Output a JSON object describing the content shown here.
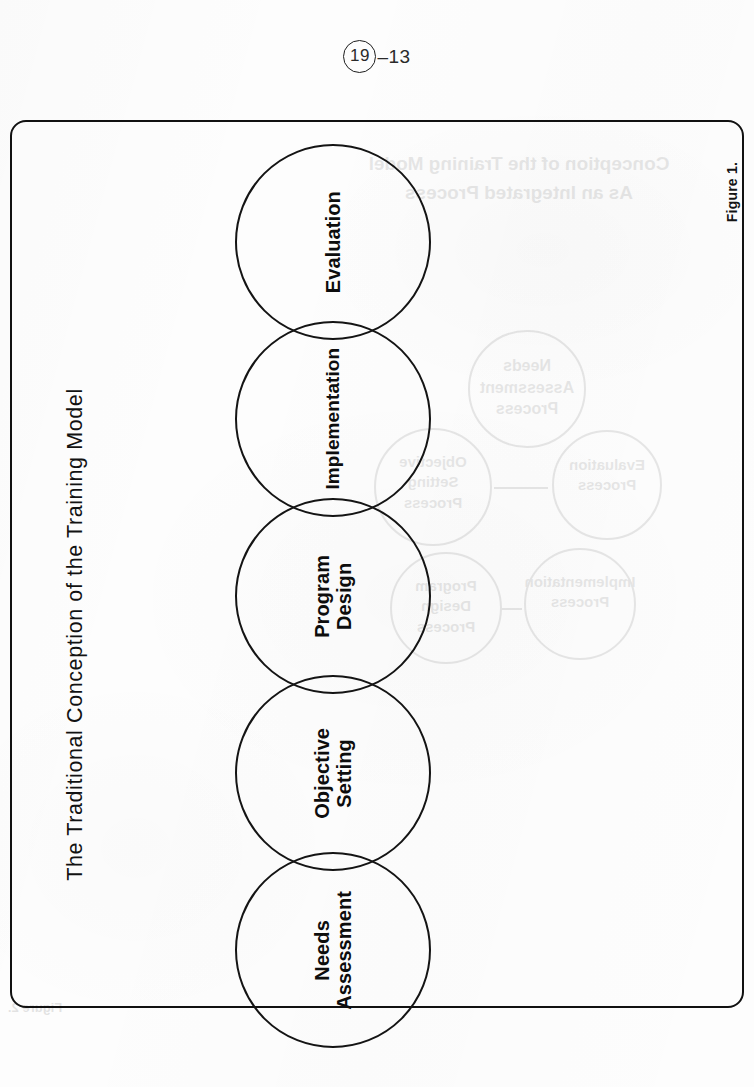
{
  "page": {
    "number_circled": "19",
    "number_suffix": "–13",
    "background_color": "#fdfdfd",
    "ink_color": "#111111"
  },
  "figure": {
    "title": "The Traditional Conception of the Training Model",
    "caption": "Figure 1.",
    "type": "linear-chain-diagram",
    "nodes": [
      {
        "id": "needs-assessment",
        "label_line1": "Needs",
        "label_line2": "Assessment"
      },
      {
        "id": "objective-setting",
        "label_line1": "Objective",
        "label_line2": "Setting"
      },
      {
        "id": "program-design",
        "label_line1": "Program",
        "label_line2": "Design"
      },
      {
        "id": "implementation",
        "label_line1": "Implementation",
        "label_line2": ""
      },
      {
        "id": "evaluation",
        "label_line1": "Evaluation",
        "label_line2": ""
      }
    ]
  },
  "bleed_through": {
    "note": "faint mirrored show-through from the reverse page",
    "title_line1": "Conception of the Training Model",
    "title_line2": "As an Integrated Process",
    "caption": "Figure 2.",
    "nodes": [
      {
        "line1": "Needs",
        "line2": "Assessment",
        "line3": "Process"
      },
      {
        "line1": "Objective",
        "line2": "Setting",
        "line3": "Process"
      },
      {
        "line1": "Evaluation",
        "line2": "Process",
        "line3": ""
      },
      {
        "line1": "Implementation",
        "line2": "Process",
        "line3": ""
      },
      {
        "line1": "Program",
        "line2": "Design",
        "line3": "Process"
      }
    ]
  }
}
